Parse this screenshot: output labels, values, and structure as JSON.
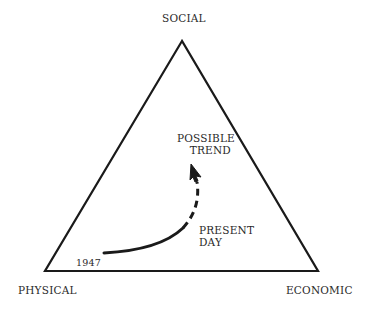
{
  "diagram": {
    "vertices": {
      "top": "SOCIAL",
      "bottom_left": "PHYSICAL",
      "bottom_right": "ECONOMIC"
    },
    "annotations": {
      "start_year": "1947",
      "present": [
        "PRESENT",
        "DAY"
      ],
      "future": [
        "POSSIBLE",
        "TREND"
      ]
    },
    "colors": {
      "line": "#1a1a1a",
      "text": "#2a2a2a",
      "background": "#ffffff"
    }
  }
}
